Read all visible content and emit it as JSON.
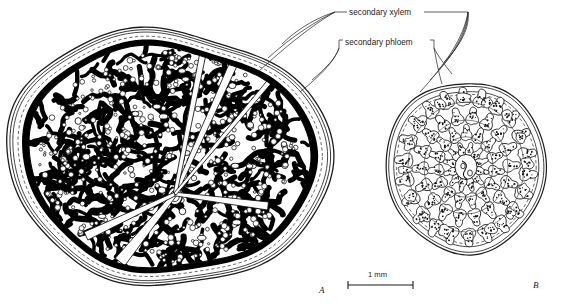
{
  "figure": {
    "kind": "botanical-cross-section-illustration",
    "style": "black-and-white line drawing",
    "panels": [
      {
        "id": "A",
        "label": "A",
        "description": "transverse section of older stem with extensive secondary xylem and islands of secondary phloem"
      },
      {
        "id": "B",
        "label": "B",
        "description": "transverse section of younger stem with discrete vascular bundles in concentric rings"
      }
    ]
  },
  "labels": [
    {
      "id": "secondary-xylem",
      "text": "secondary xylem"
    },
    {
      "id": "secondary-phloem",
      "text": "secondary phloem"
    }
  ],
  "panel_labels": {
    "a": "A",
    "b": "B"
  },
  "scale": {
    "value": "1",
    "unit": "mm",
    "text": "1  mm"
  },
  "colors": {
    "ink": "#000000",
    "line": "#1c1c1c",
    "background": "#ffffff",
    "leader": "#2b2b2b"
  }
}
